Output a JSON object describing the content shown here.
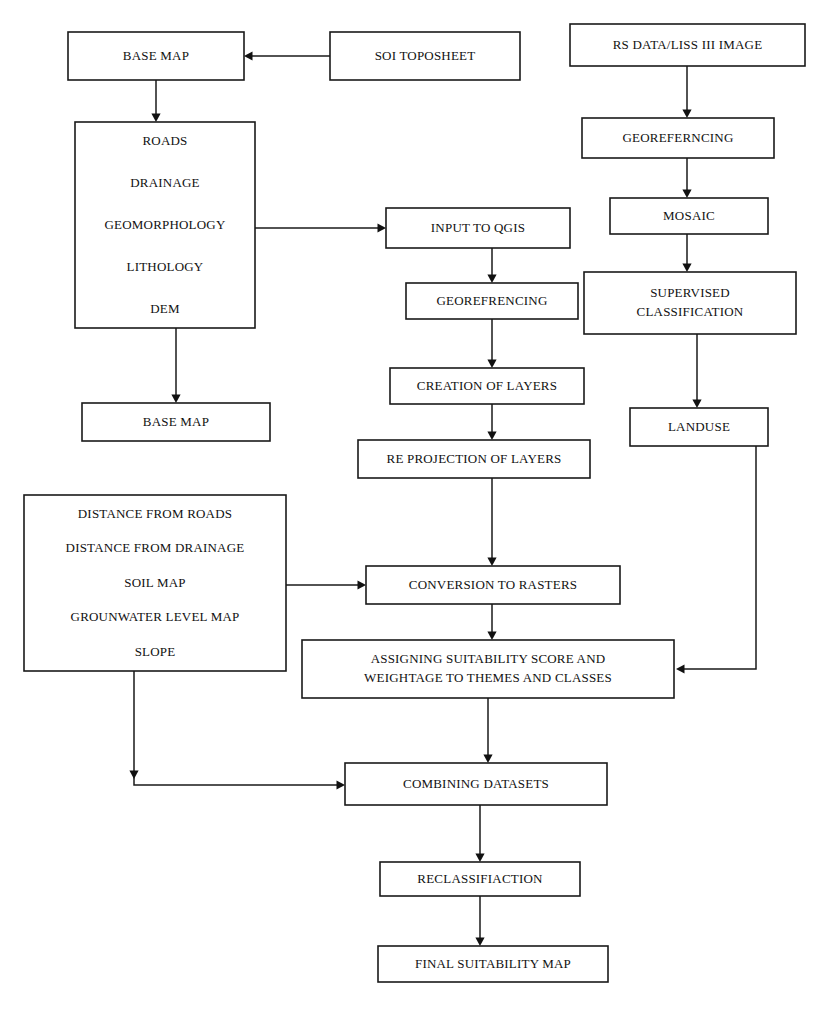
{
  "diagram": {
    "type": "flowchart",
    "background_color": "#ffffff",
    "line_color": "#1a1a1a",
    "text_color": "#111111",
    "width": 825,
    "height": 1013
  },
  "nodes": [
    {
      "id": "base_map_top",
      "label": "BASE MAP",
      "lines": [
        "BASE MAP"
      ],
      "x": 68,
      "y": 32,
      "w": 176,
      "h": 48
    },
    {
      "id": "soi_toposheet",
      "label": "SOI TOPOSHEET",
      "lines": [
        "SOI TOPOSHEET"
      ],
      "x": 330,
      "y": 32,
      "w": 190,
      "h": 48
    },
    {
      "id": "rs_data",
      "label": "RS DATA/LISS III IMAGE",
      "lines": [
        "RS DATA/LISS III IMAGE"
      ],
      "x": 570,
      "y": 24,
      "w": 235,
      "h": 42
    },
    {
      "id": "themes_box",
      "label": "ROADS / DRAINAGE / GEOMORPHOLOGY / LITHOLOGY / DEM",
      "lines": [
        "ROADS",
        "DRAINAGE",
        "GEOMORPHOLOGY",
        "LITHOLOGY",
        "DEM"
      ],
      "x": 75,
      "y": 122,
      "w": 180,
      "h": 206
    },
    {
      "id": "georef_right",
      "label": "GEOREFERNCING",
      "lines": [
        "GEOREFERNCING"
      ],
      "x": 582,
      "y": 118,
      "w": 192,
      "h": 40
    },
    {
      "id": "mosaic",
      "label": "MOSAIC",
      "lines": [
        "MOSAIC"
      ],
      "x": 610,
      "y": 198,
      "w": 158,
      "h": 36
    },
    {
      "id": "input_qgis",
      "label": "INPUT TO QGIS",
      "lines": [
        "INPUT TO QGIS"
      ],
      "x": 386,
      "y": 208,
      "w": 184,
      "h": 40
    },
    {
      "id": "supervised_classification",
      "label": "SUPERVISED CLASSIFICATION",
      "lines": [
        "SUPERVISED",
        "CLASSIFICATION"
      ],
      "x": 584,
      "y": 272,
      "w": 212,
      "h": 62
    },
    {
      "id": "georef_mid",
      "label": "GEOREFRENCING",
      "lines": [
        "GEOREFRENCING"
      ],
      "x": 406,
      "y": 283,
      "w": 172,
      "h": 36
    },
    {
      "id": "creation_of_layers",
      "label": "CREATION OF LAYERS",
      "lines": [
        "CREATION OF LAYERS"
      ],
      "x": 390,
      "y": 368,
      "w": 194,
      "h": 36
    },
    {
      "id": "landuse",
      "label": "LANDUSE",
      "lines": [
        "LANDUSE"
      ],
      "x": 630,
      "y": 408,
      "w": 138,
      "h": 38
    },
    {
      "id": "re_projection",
      "label": "RE PROJECTION OF LAYERS",
      "lines": [
        "RE PROJECTION OF LAYERS"
      ],
      "x": 358,
      "y": 440,
      "w": 232,
      "h": 38
    },
    {
      "id": "criteria_box",
      "label": "DISTANCE FROM ROADS / DISTANCE FROM DRAINAGE / SOIL MAP / GROUNWATER LEVEL MAP / SLOPE",
      "lines": [
        "DISTANCE FROM ROADS",
        "DISTANCE FROM DRAINAGE",
        "SOIL MAP",
        "GROUNWATER LEVEL MAP",
        "SLOPE"
      ],
      "x": 24,
      "y": 495,
      "w": 262,
      "h": 176
    },
    {
      "id": "base_map_bottom",
      "label": "BASE MAP",
      "lines": [
        "BASE MAP"
      ],
      "x": 82,
      "y": 403,
      "w": 188,
      "h": 38
    },
    {
      "id": "conversion_rasters",
      "label": "CONVERSION TO RASTERS",
      "lines": [
        "CONVERSION TO RASTERS"
      ],
      "x": 366,
      "y": 566,
      "w": 254,
      "h": 38
    },
    {
      "id": "assigning_scores",
      "label": "ASSIGNING SUITABILITY SCORE AND WEIGHTAGE TO THEMES AND CLASSES",
      "lines": [
        "ASSIGNING SUITABILITY SCORE AND",
        "WEIGHTAGE TO THEMES AND CLASSES"
      ],
      "x": 302,
      "y": 640,
      "w": 372,
      "h": 58
    },
    {
      "id": "combining_datasets",
      "label": "COMBINING DATASETS",
      "lines": [
        "COMBINING DATASETS"
      ],
      "x": 345,
      "y": 763,
      "w": 262,
      "h": 42
    },
    {
      "id": "reclassification",
      "label": "RECLASSIFIACTION",
      "lines": [
        "RECLASSIFIACTION"
      ],
      "x": 380,
      "y": 862,
      "w": 200,
      "h": 34
    },
    {
      "id": "final_suitability_map",
      "label": "FINAL SUITABILITY MAP",
      "lines": [
        "FINAL SUITABILITY MAP"
      ],
      "x": 378,
      "y": 946,
      "w": 230,
      "h": 36
    }
  ],
  "edges": [
    {
      "id": "e-soi-basemap",
      "from": "soi_toposheet",
      "to": "base_map_top",
      "points": "330,56 250,56",
      "arrow": "left",
      "arrow_at": "244,56"
    },
    {
      "id": "e-basemap-themes",
      "from": "base_map_top",
      "to": "themes_box",
      "points": "156,80 156,116",
      "arrow": "down",
      "arrow_at": "156,122"
    },
    {
      "id": "e-themes-qgis",
      "from": "themes_box",
      "to": "input_qgis",
      "points": "255,228 380,228",
      "arrow": "right",
      "arrow_at": "386,228"
    },
    {
      "id": "e-themes-basemap2",
      "from": "themes_box",
      "to": "base_map_bottom",
      "points": "176,328 176,397",
      "arrow": "down",
      "arrow_at": "176,403"
    },
    {
      "id": "e-rs-georef",
      "from": "rs_data",
      "to": "georef_right",
      "points": "687,66 687,112",
      "arrow": "down",
      "arrow_at": "687,118"
    },
    {
      "id": "e-georef-mosaic",
      "from": "georef_right",
      "to": "mosaic",
      "points": "687,158 687,192",
      "arrow": "down",
      "arrow_at": "687,198"
    },
    {
      "id": "e-mosaic-supervised",
      "from": "mosaic",
      "to": "supervised_classification",
      "points": "687,234 687,266",
      "arrow": "down",
      "arrow_at": "687,272"
    },
    {
      "id": "e-supervised-landuse",
      "from": "supervised_classification",
      "to": "landuse",
      "points": "697,334 697,402",
      "arrow": "down",
      "arrow_at": "697,408"
    },
    {
      "id": "e-qgis-georefmid",
      "from": "input_qgis",
      "to": "georef_mid",
      "points": "492,248 492,277",
      "arrow": "down",
      "arrow_at": "492,283"
    },
    {
      "id": "e-georefmid-creation",
      "from": "georef_mid",
      "to": "creation_of_layers",
      "points": "492,319 492,362",
      "arrow": "down",
      "arrow_at": "492,368"
    },
    {
      "id": "e-creation-reproj",
      "from": "creation_of_layers",
      "to": "re_projection",
      "points": "492,404 492,434",
      "arrow": "down",
      "arrow_at": "492,440"
    },
    {
      "id": "e-reproj-conversion",
      "from": "re_projection",
      "to": "conversion_rasters",
      "points": "492,478 492,560",
      "arrow": "down",
      "arrow_at": "492,566"
    },
    {
      "id": "e-criteria-conversion",
      "from": "criteria_box",
      "to": "conversion_rasters",
      "points": "286,585 360,585",
      "arrow": "right",
      "arrow_at": "366,585"
    },
    {
      "id": "e-conversion-assigning",
      "from": "conversion_rasters",
      "to": "assigning_scores",
      "points": "492,604 492,634",
      "arrow": "down",
      "arrow_at": "492,640"
    },
    {
      "id": "e-landuse-assigning",
      "from": "landuse",
      "to": "assigning_scores",
      "points": "756,446 756,669 682,669",
      "arrow": "left",
      "arrow_at": "676,669"
    },
    {
      "id": "e-assigning-combining",
      "from": "assigning_scores",
      "to": "combining_datasets",
      "points": "488,698 488,757",
      "arrow": "down",
      "arrow_at": "488,763"
    },
    {
      "id": "e-criteria-combining",
      "from": "criteria_box",
      "to": "combining_datasets",
      "points": "134,671 134,785 339,785",
      "arrow": "both",
      "arrow_at": "345,785",
      "arrow_mid": "134,779"
    },
    {
      "id": "e-combining-reclass",
      "from": "combining_datasets",
      "to": "reclassification",
      "points": "480,805 480,856",
      "arrow": "down",
      "arrow_at": "480,862"
    },
    {
      "id": "e-reclass-final",
      "from": "reclassification",
      "to": "final_suitability_map",
      "points": "480,896 480,940",
      "arrow": "down",
      "arrow_at": "480,946"
    }
  ]
}
